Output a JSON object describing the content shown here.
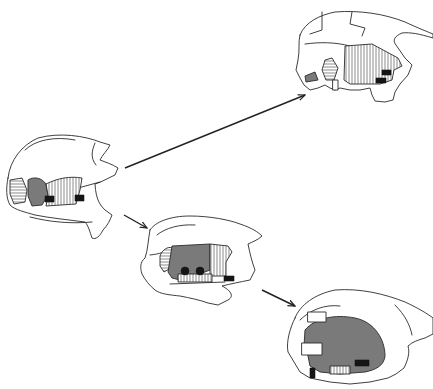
{
  "figure": {
    "colors": {
      "line": "#2a2a2a",
      "shaded_region": "#7a7a7a",
      "solid": "#151515",
      "background": "#ffffff"
    },
    "panels": [
      {
        "id": "stage-a",
        "position": "left",
        "bbox": [
          0,
          120,
          122,
          250
        ]
      },
      {
        "id": "stage-b",
        "position": "top-right",
        "bbox": [
          290,
          0,
          433,
          110
        ]
      },
      {
        "id": "stage-c",
        "position": "center",
        "bbox": [
          140,
          205,
          265,
          310
        ]
      },
      {
        "id": "stage-d",
        "position": "bottom-right",
        "bbox": [
          280,
          285,
          433,
          389
        ]
      }
    ],
    "arrows": [
      {
        "from": "stage-a",
        "to": "stage-b",
        "start": [
          125,
          168
        ],
        "end": [
          305,
          95
        ]
      },
      {
        "from": "stage-a",
        "to": "stage-c",
        "start": [
          124,
          215
        ],
        "end": [
          147,
          228
        ]
      },
      {
        "from": "stage-c",
        "to": "stage-d",
        "start": [
          262,
          290
        ],
        "end": [
          295,
          306
        ]
      }
    ]
  }
}
